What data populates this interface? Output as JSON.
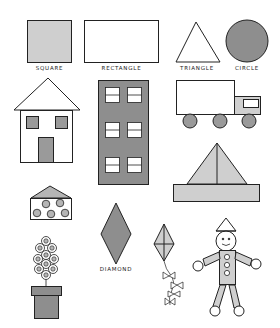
{
  "colors": {
    "outline": "#222222",
    "light_gray": "#cfcfcf",
    "mid_gray": "#a9a9a9",
    "dark_gray": "#8e8e8e",
    "background": "#ffffff"
  },
  "labels": {
    "square": "SQUARE",
    "rectangle": "RECTANGLE",
    "triangle": "TRIANGLE",
    "circle": "CIRCLE",
    "diamond": "DIAMOND"
  },
  "shapes": [
    {
      "name": "square",
      "fill": "light_gray"
    },
    {
      "name": "rectangle",
      "fill": "white"
    },
    {
      "name": "triangle",
      "fill": "white"
    },
    {
      "name": "circle",
      "fill": "dark_gray"
    },
    {
      "name": "house"
    },
    {
      "name": "building",
      "windows": 6
    },
    {
      "name": "truck",
      "wheels": 3
    },
    {
      "name": "sailboat"
    },
    {
      "name": "box-with-circles",
      "circles": 5
    },
    {
      "name": "diamond"
    },
    {
      "name": "kite",
      "bows": 4
    },
    {
      "name": "flower-pot",
      "flowers": 10
    },
    {
      "name": "clown-figure",
      "buttons": 3
    }
  ]
}
